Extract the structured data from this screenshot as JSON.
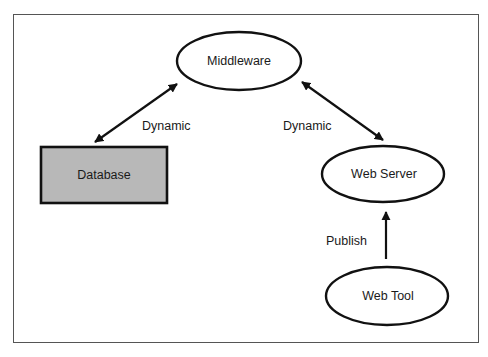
{
  "diagram": {
    "nodes": [
      {
        "id": "middleware",
        "label": "Middleware",
        "shape": "ellipse"
      },
      {
        "id": "database",
        "label": "Database",
        "shape": "rectangle",
        "fill": "#b8b8b8"
      },
      {
        "id": "web_server",
        "label": "Web Server",
        "shape": "ellipse"
      },
      {
        "id": "web_tool",
        "label": "Web Tool",
        "shape": "ellipse"
      }
    ],
    "edges": [
      {
        "from": "database",
        "to": "middleware",
        "label": "Dynamic",
        "direction": "bidirectional"
      },
      {
        "from": "middleware",
        "to": "web_server",
        "label": "Dynamic",
        "direction": "bidirectional"
      },
      {
        "from": "web_tool",
        "to": "web_server",
        "label": "Publish",
        "direction": "forward"
      }
    ]
  },
  "colors": {
    "stroke": "#111111",
    "frame": "#555555",
    "database_fill": "#b8b8b8",
    "background": "#ffffff"
  }
}
